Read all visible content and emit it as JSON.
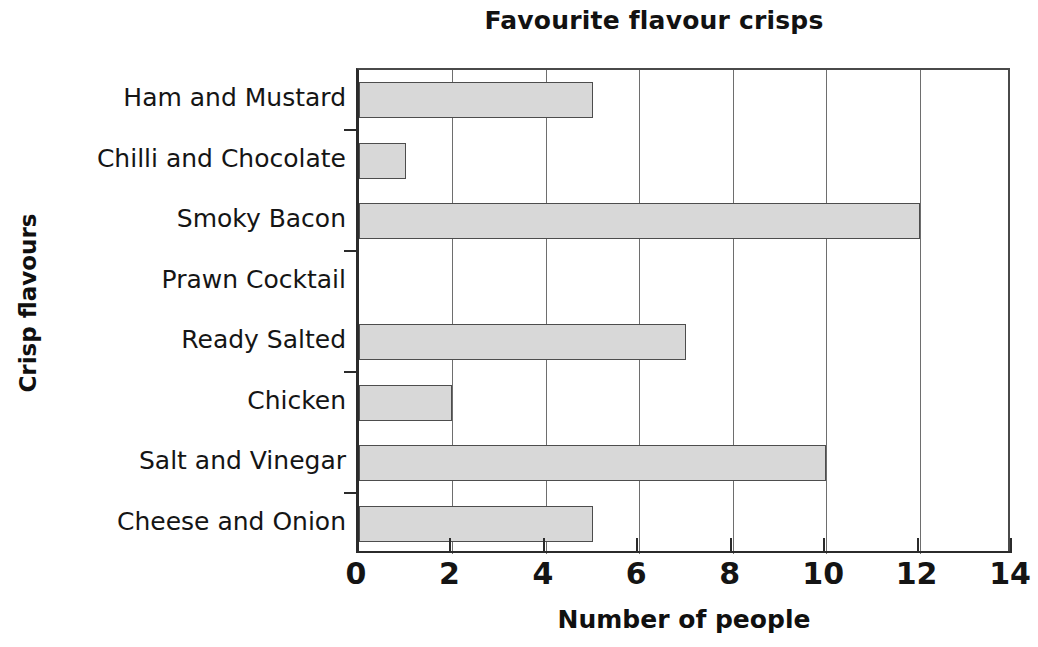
{
  "chart_data": {
    "type": "bar",
    "orientation": "horizontal",
    "title": "Favourite flavour crisps",
    "xlabel": "Number of people",
    "ylabel": "Crisp flavours",
    "categories": [
      "Ham and Mustard",
      "Chilli and Chocolate",
      "Smoky Bacon",
      "Prawn Cocktail",
      "Ready Salted",
      "Chicken",
      "Salt and Vinegar",
      "Cheese and Onion"
    ],
    "values": [
      5,
      1,
      12,
      0,
      7,
      2,
      10,
      5
    ],
    "xlim": [
      0,
      14
    ],
    "xticks": [
      0,
      2,
      4,
      6,
      8,
      10,
      12,
      14
    ],
    "xtick_labels": [
      "0",
      "2",
      "4",
      "6",
      "8",
      "10",
      "12",
      "14"
    ],
    "grid": "vertical-at-xticks",
    "legend": "none",
    "bar_color": "#d8d8d8",
    "bar_border_color": "#4d4d4d",
    "axis_color": "#2b2b2b",
    "grid_color": "#6e6e6e",
    "text_color": "#141414"
  }
}
